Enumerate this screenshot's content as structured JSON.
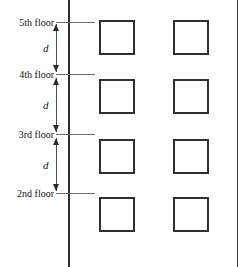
{
  "figure": {
    "type": "building-elevation-diagram",
    "width": 244,
    "height": 267,
    "line_color": "#2b2b2b",
    "background_color": "#ffffff"
  },
  "wall": {
    "label": "wall-line",
    "x": 68,
    "top": 0,
    "bottom": 267
  },
  "floors": [
    {
      "label": "5th floor",
      "y": 22,
      "line_y": 22
    },
    {
      "label": "4th floor",
      "y": 74,
      "line_y": 74
    },
    {
      "label": "3rd floor",
      "y": 134,
      "line_y": 134
    },
    {
      "label": "2nd floor",
      "y": 193,
      "line_y": 193
    }
  ],
  "dimensions": [
    {
      "label": "d",
      "from": "5th floor",
      "to": "4th floor",
      "top": 24,
      "height": 48
    },
    {
      "label": "d",
      "from": "4th floor",
      "to": "3rd floor",
      "top": 78,
      "height": 54
    },
    {
      "label": "d",
      "from": "3rd floor",
      "to": "2nd floor",
      "top": 138,
      "height": 53
    }
  ],
  "windows": {
    "columns_x": [
      99,
      173
    ],
    "rows_y": [
      20,
      79,
      139,
      197
    ],
    "width": 36,
    "height": 35,
    "count": 8
  }
}
